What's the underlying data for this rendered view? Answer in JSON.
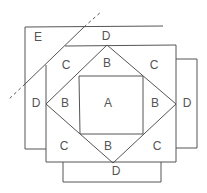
{
  "diagram": {
    "type": "quilt-block-piecing-diagram",
    "line_color": "#555555",
    "labels": [
      {
        "id": "A-center",
        "text": "A",
        "x": 108,
        "y": 104
      },
      {
        "id": "B-top",
        "text": "B",
        "x": 107,
        "y": 64
      },
      {
        "id": "B-left",
        "text": "B",
        "x": 65,
        "y": 104
      },
      {
        "id": "B-right",
        "text": "B",
        "x": 155,
        "y": 104
      },
      {
        "id": "B-bottom",
        "text": "B",
        "x": 108,
        "y": 147
      },
      {
        "id": "C-top-left",
        "text": "C",
        "x": 66,
        "y": 66
      },
      {
        "id": "C-top-right",
        "text": "C",
        "x": 154,
        "y": 66
      },
      {
        "id": "C-bottom-left",
        "text": "C",
        "x": 64,
        "y": 147
      },
      {
        "id": "C-bottom-right",
        "text": "C",
        "x": 157,
        "y": 147
      },
      {
        "id": "D-top",
        "text": "D",
        "x": 106,
        "y": 37
      },
      {
        "id": "D-left",
        "text": "D",
        "x": 36,
        "y": 104
      },
      {
        "id": "D-right",
        "text": "D",
        "x": 187,
        "y": 104
      },
      {
        "id": "D-bottom",
        "text": "D",
        "x": 116,
        "y": 172
      },
      {
        "id": "E-corner",
        "text": "E",
        "x": 38,
        "y": 38
      }
    ]
  }
}
